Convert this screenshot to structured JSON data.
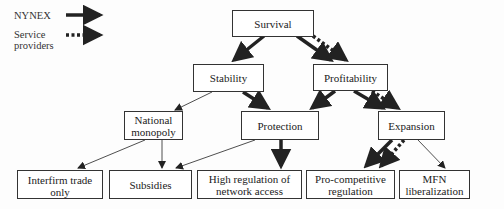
{
  "legend": {
    "nynex": "NYNEX",
    "service_line1": "Service",
    "service_line2": "providers"
  },
  "nodes": {
    "survival": "Survival",
    "stability": "Stability",
    "profitability": "Profitability",
    "national_line1": "National",
    "national_line2": "monopoly",
    "protection": "Protection",
    "expansion": "Expansion",
    "interfirm": "Interfirm trade only",
    "subsidies": "Subsidies",
    "highreg_line1": "High regulation of",
    "highreg_line2": "network access",
    "procomp_line1": "Pro-competitive",
    "procomp_line2": "regulation",
    "mfn_line1": "MFN",
    "mfn_line2": "liberalization"
  },
  "colors": {
    "line": "#222222",
    "box_border": "#333333"
  }
}
